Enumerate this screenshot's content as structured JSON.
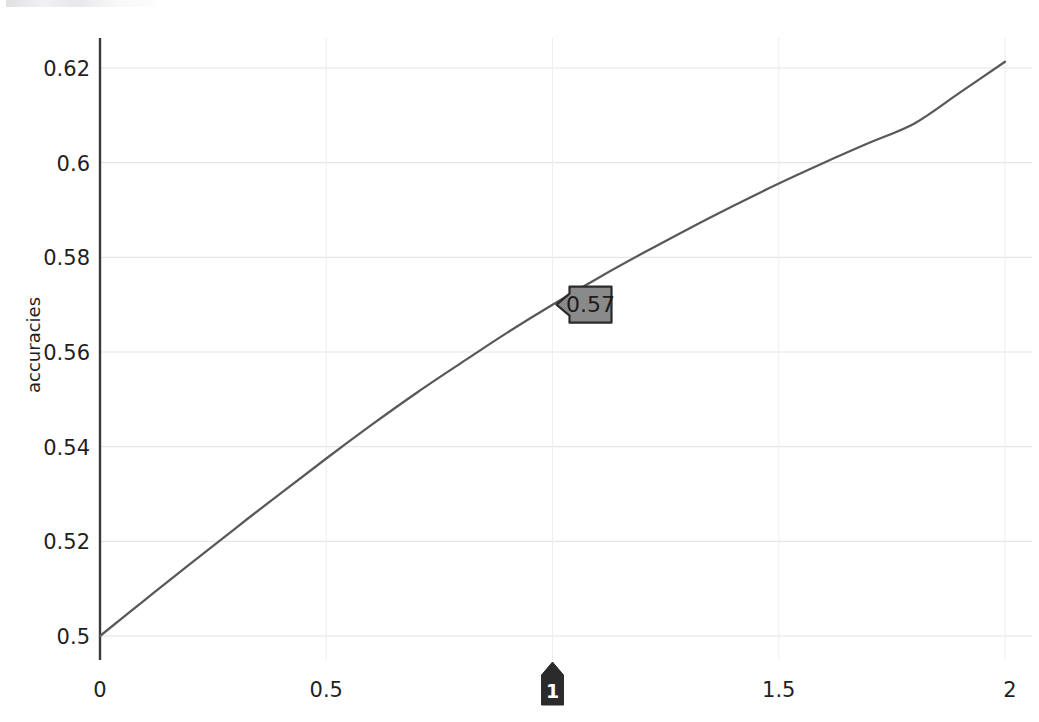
{
  "chart_data": {
    "type": "line",
    "title": "",
    "subtitle": "",
    "xlabel": "",
    "ylabel": "accuracies",
    "xlim": [
      0,
      2
    ],
    "ylim": [
      0.4972,
      0.6232
    ],
    "grid": true,
    "legend": null,
    "legend_position": "none",
    "x_ticks": [
      "0",
      "0.5",
      "1",
      "1.5",
      "2"
    ],
    "x_tick_values": [
      0,
      0.5,
      1,
      1.5,
      2
    ],
    "y_ticks": [
      "0.5",
      "0.52",
      "0.54",
      "0.56",
      "0.58",
      "0.6",
      "0.62"
    ],
    "y_tick_values": [
      0.5,
      0.52,
      0.54,
      0.56,
      0.58,
      0.6,
      0.62
    ],
    "series": [
      {
        "name": "accuracies",
        "color": "#595959",
        "x": [
          0,
          0.1,
          0.2,
          0.3,
          0.4,
          0.5,
          0.6,
          0.7,
          0.8,
          0.9,
          1.0,
          1.1,
          1.2,
          1.3,
          1.4,
          1.5,
          1.6,
          1.7,
          1.8,
          1.9,
          2.0
        ],
        "values": [
          0.5,
          0.5077,
          0.5153,
          0.5228,
          0.5302,
          0.5375,
          0.5446,
          0.5514,
          0.5578,
          0.5641,
          0.57,
          0.5756,
          0.5809,
          0.586,
          0.5909,
          0.5956,
          0.6,
          0.6042,
          0.6083,
          0.6148,
          0.6213
        ]
      }
    ],
    "annotations": [
      {
        "name": "value-tooltip",
        "label": "0.57",
        "x": 1.0,
        "y": 0.57,
        "style": "callout-left-arrow",
        "fill": "#8a8a8a",
        "stroke": "#2b2b2b",
        "text_color": "#1c1c1c"
      },
      {
        "name": "x-axis-marker",
        "label": "1",
        "x": 1.0,
        "style": "pin-up",
        "fill": "#2b2b2b",
        "text_color": "#ffffff"
      }
    ],
    "axis_color": "#3a3a3a",
    "grid_color": "#e6e6ea",
    "line_color": "#595959",
    "background": "#ffffff"
  }
}
